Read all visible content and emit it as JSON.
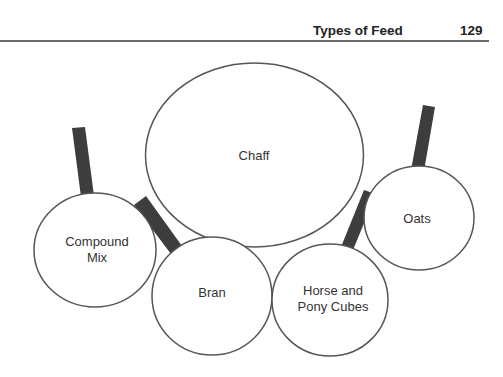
{
  "header": {
    "title": "Types of Feed",
    "page_number": "129"
  },
  "diagram": {
    "colors": {
      "outline": "#555555",
      "handle": "#3d3d3d",
      "background": "#ffffff"
    },
    "items": [
      {
        "id": "chaff",
        "lines": [
          "Chaff"
        ]
      },
      {
        "id": "compound-mix",
        "lines": [
          "Compound",
          "Mix"
        ]
      },
      {
        "id": "bran",
        "lines": [
          "Bran"
        ]
      },
      {
        "id": "horse-pony-cubes",
        "lines": [
          "Horse and",
          "Pony Cubes"
        ]
      },
      {
        "id": "oats",
        "lines": [
          "Oats"
        ]
      }
    ]
  }
}
